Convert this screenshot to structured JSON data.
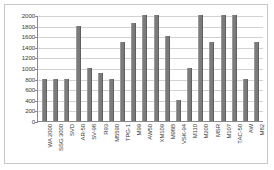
{
  "chart_data": {
    "type": "bar",
    "title": "",
    "subtitle": "",
    "xlabel": "",
    "ylabel": "",
    "ylim": [
      0,
      2000
    ],
    "ytick_step": 200,
    "grid": true,
    "legend": false,
    "legend_position": "none",
    "bar_color": "#7b7b7b",
    "categories": [
      "WA 2000",
      "SSG 3000",
      "SVD",
      "AR-50",
      "SV-98",
      "R93",
      "M5590",
      "TPG-1",
      "M99",
      "AW50",
      "XM109",
      "M98B",
      "VSK-94",
      "M110",
      "M200",
      "MSR",
      "M107",
      "TAC-50",
      "AW",
      "M82"
    ],
    "values": [
      800,
      800,
      800,
      1800,
      1000,
      900,
      800,
      1500,
      1850,
      2000,
      2000,
      1600,
      400,
      1000,
      2000,
      1500,
      2000,
      2000,
      800,
      1500
    ],
    "ytick_labels": [
      "0",
      "200",
      "400",
      "600",
      "800",
      "1000",
      "1200",
      "1400",
      "1600",
      "1800",
      "2000"
    ]
  },
  "colors": {
    "bar": "#7b7b7b",
    "grid": "#d2d2d2",
    "axis": "#8a8a8a",
    "border": "#c9c9c9",
    "text": "#3a3a3a",
    "background": "#ffffff"
  }
}
